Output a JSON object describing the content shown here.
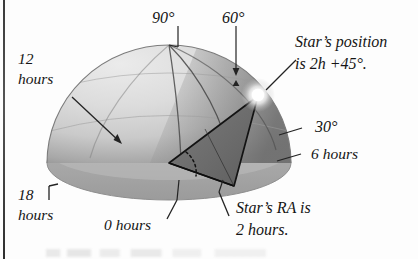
{
  "figure": {
    "kind": "celestial-sphere-diagram"
  },
  "declination_labels": [
    {
      "id": "dec-90",
      "text": "90°"
    },
    {
      "id": "dec-60",
      "text": "60°"
    },
    {
      "id": "dec-30",
      "text": "30°"
    }
  ],
  "ra_labels": [
    {
      "id": "ra-12",
      "line1": "12",
      "line2": "hours"
    },
    {
      "id": "ra-18",
      "line1": "18",
      "line2": "hours"
    },
    {
      "id": "ra-0",
      "text": "0 hours"
    },
    {
      "id": "ra-6",
      "text": "6 hours"
    }
  ],
  "annotations": [
    {
      "id": "star-position",
      "line1": "Star’s position",
      "line2": "is 2h +45°."
    },
    {
      "id": "star-ra",
      "line1": "Star’s RA is",
      "line2": "2 hours."
    }
  ],
  "star": {
    "name": "star-marker",
    "right_ascension": "2h",
    "declination": "+45°"
  },
  "colors": {
    "dome_light": "#d8d8d8",
    "dome_mid": "#c2c2c2",
    "dome_dark": "#8e8e8e",
    "base_ellipse": "#a9a9a9",
    "base_shadow": "#9a9a9a",
    "wedge": "#6f6f6f",
    "outline": "#1b1b1b",
    "text": "#141414",
    "star_core": "#ffffff",
    "background": "#fdfdfd"
  },
  "icons": {
    "star": "star-glow-icon",
    "arrow": "arrow-leader-icon",
    "bracket": "bracket-leader-icon"
  }
}
